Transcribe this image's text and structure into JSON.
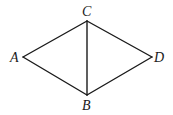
{
  "diagram": {
    "type": "geometry",
    "background": "#ffffff",
    "stroke_color": "#1a1a1a",
    "vertices": {
      "A": {
        "label": "A",
        "x": 23,
        "y": 57
      },
      "B": {
        "label": "B",
        "x": 87,
        "y": 95
      },
      "C": {
        "label": "C",
        "x": 87,
        "y": 21
      },
      "D": {
        "label": "D",
        "x": 152,
        "y": 57
      }
    },
    "edges": [
      [
        "A",
        "C"
      ],
      [
        "C",
        "D"
      ],
      [
        "D",
        "B"
      ],
      [
        "B",
        "A"
      ],
      [
        "C",
        "B"
      ]
    ]
  }
}
